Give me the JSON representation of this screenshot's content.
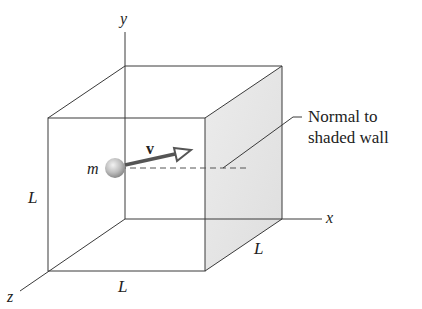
{
  "diagram": {
    "axes": {
      "x": "x",
      "y": "y",
      "z": "z"
    },
    "edge_labels": {
      "vertical": "L",
      "bottom": "L",
      "depth": "L"
    },
    "particle": {
      "mass_label": "m",
      "velocity_label": "v"
    },
    "callout": {
      "line1": "Normal to",
      "line2": "shaded wall"
    },
    "colors": {
      "line": "#3a3a3a",
      "shaded_wall": "#e4e4e4",
      "arrow": "#555555",
      "particle": "#b8b8b8"
    }
  }
}
